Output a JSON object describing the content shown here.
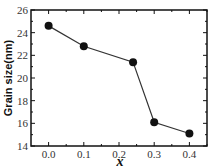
{
  "chart_data": {
    "type": "line",
    "title": "",
    "xlabel": "x",
    "ylabel": "Grain size(nm)",
    "x": [
      0.0,
      0.1,
      0.24,
      0.3,
      0.4
    ],
    "series": [
      {
        "name": "Grain size",
        "values": [
          24.6,
          22.8,
          21.4,
          16.1,
          15.1
        ]
      }
    ],
    "xlim": [
      -0.05,
      0.45
    ],
    "ylim": [
      14,
      26
    ],
    "xticks": [
      "0.0",
      "0.1",
      "0.2",
      "0.3",
      "0.4"
    ],
    "yticks": [
      "14",
      "16",
      "18",
      "20",
      "22",
      "24",
      "26"
    ],
    "grid": false,
    "legend": "none",
    "marker": "filled-circle",
    "colors": {
      "line": "#333333",
      "marker": "#111111",
      "axis": "#111111"
    }
  }
}
